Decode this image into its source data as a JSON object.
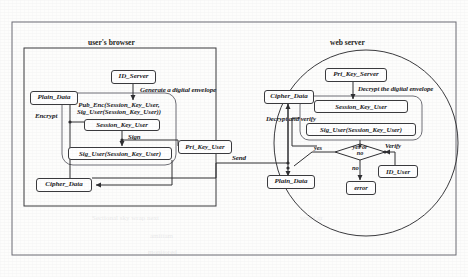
{
  "sections": {
    "browser_label": "user's browser",
    "server_label": "web server"
  },
  "browser": {
    "id_server": "ID_Server",
    "generate_envelope": "Generate a digital envelope",
    "plain_data": "Plain_Data",
    "encrypt": "Encrypt",
    "envelope_line1": "Pub_Enc(Session_Key_User,",
    "envelope_line2": "Sig_User(Session_Key_User))",
    "session_key_user": "Session_Key_User",
    "sign": "Sign",
    "sig_user": "Sig_User(Session_Key_User)",
    "pri_key_user": "Pri_Key_User",
    "cipher_data": "Cipher_Data"
  },
  "transport": {
    "send": "Send"
  },
  "server": {
    "pri_key_server": "Pri_Key_Server",
    "decrypt_envelope": "Decrypt the digital envelope",
    "cipher_data": "Cipher_Data",
    "decrypt_and_verify": "Decrypt and verify",
    "session_key_user": "Session_Key_User",
    "sig_user": "Sig_User(Session_Key_User)",
    "decision_line1": "yes or",
    "decision_line2": "no",
    "yes": "yes",
    "no": "no",
    "verify": "Verify",
    "id_user": "ID_User",
    "plain_data": "Plain_Data",
    "error": "error"
  },
  "colors": {
    "stroke": "#3a3a3d",
    "text": "#19191c",
    "background": "#fdfdfc"
  }
}
